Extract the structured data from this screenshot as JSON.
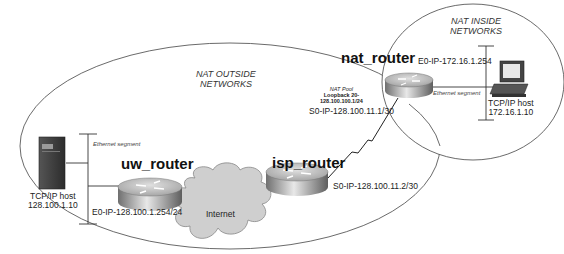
{
  "zones": {
    "outside": {
      "label_line1": "NAT OUTSIDE",
      "label_line2": "NETWORKS"
    },
    "inside": {
      "label_line1": "NAT INSIDE",
      "label_line2": "NETWORKS"
    }
  },
  "routers": {
    "nat": {
      "name": "nat_router",
      "e0": "E0-IP-172.16.1.254",
      "s0": "S0-IP-128.100.11.1/30",
      "pool_title": "NAT Pool",
      "pool_line1": "Loopback 20-",
      "pool_line2": "128.100.100.1/24"
    },
    "isp": {
      "name": "isp_router",
      "s0": "S0-IP-128.100.11.2/30"
    },
    "uw": {
      "name": "uw_router",
      "e0": "E0-IP-128.100.1.254/24"
    }
  },
  "cloud": {
    "label": "Internet"
  },
  "hosts": {
    "outside": {
      "line1": "TCP/IP host",
      "line2": "128.100.1.10",
      "segment": "Ethernet segment"
    },
    "inside": {
      "line1": "TCP/IP host",
      "line2": "172.16.1.10",
      "segment": "Ethernet segment"
    }
  },
  "colors": {
    "line": "#333333",
    "router_top": "#c8c8c8",
    "router_side": "#8a8a8a",
    "cloud": "#cfcfcf"
  }
}
